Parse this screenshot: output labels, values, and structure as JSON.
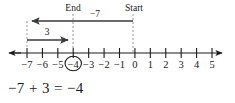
{
  "figure": {
    "type": "number-line-diagram",
    "equation": "−7 + 3 = −4",
    "background_color": "#ffffff",
    "ink_color": "#1a1a1a",
    "guide_color": "#8a8a8a"
  },
  "number_line": {
    "ticks": [
      {
        "value": -7,
        "label": "−7"
      },
      {
        "value": -6,
        "label": "−6"
      },
      {
        "value": -5,
        "label": "−5"
      },
      {
        "value": -4,
        "label": "−4"
      },
      {
        "value": -3,
        "label": "−3"
      },
      {
        "value": -2,
        "label": "−2"
      },
      {
        "value": -1,
        "label": "−1"
      },
      {
        "value": 0,
        "label": "0"
      },
      {
        "value": 1,
        "label": "1"
      },
      {
        "value": 2,
        "label": "2"
      },
      {
        "value": 3,
        "label": "3"
      },
      {
        "value": 4,
        "label": "4"
      },
      {
        "value": 5,
        "label": "5"
      }
    ],
    "min": -7,
    "max": 5,
    "left_arrow": true,
    "right_arrow": true,
    "circled_value": -4
  },
  "markers": {
    "end": {
      "label": "End",
      "value": -4
    },
    "start": {
      "label": "Start",
      "value": 0
    }
  },
  "jumps": [
    {
      "name": "negative-seven-jump",
      "label": "−7",
      "from": 0,
      "to": -7,
      "direction": "left",
      "magnitude": 7
    },
    {
      "name": "plus-three-jump",
      "label": "3",
      "from": -7,
      "to": -4,
      "direction": "right",
      "magnitude": 3
    }
  ],
  "chart_data": {
    "type": "line",
    "title": "",
    "xlabel": "",
    "ylabel": "",
    "categories": [
      "−7",
      "−6",
      "−5",
      "−4",
      "−3",
      "−2",
      "−1",
      "0",
      "1",
      "2",
      "3",
      "4",
      "5"
    ],
    "values": [
      -7,
      -6,
      -5,
      -4,
      -3,
      -2,
      -1,
      0,
      1,
      2,
      3,
      4,
      5
    ],
    "xlim": [
      -7,
      5
    ],
    "grid": false,
    "annotations": [
      "Start",
      "End",
      "−7",
      "3",
      "−7 + 3 = −4"
    ]
  }
}
